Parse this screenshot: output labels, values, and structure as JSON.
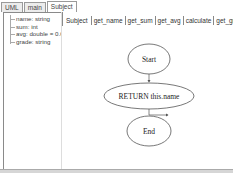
{
  "outer_tabs": [
    {
      "label": "UML",
      "active": false
    },
    {
      "label": "main",
      "active": false
    },
    {
      "label": "Subject",
      "active": true
    }
  ],
  "tree": {
    "items": [
      {
        "label": "name: string"
      },
      {
        "label": "sum: int"
      },
      {
        "label": "avg: double = 0.0"
      },
      {
        "label": "grade: string"
      }
    ]
  },
  "inner_tabs": [
    {
      "label": "Subject",
      "active": false
    },
    {
      "label": "get_name",
      "active": true
    },
    {
      "label": "get_sum",
      "active": false
    },
    {
      "label": "get_avg",
      "active": false
    },
    {
      "label": "calculate",
      "active": false
    },
    {
      "label": "get_grade",
      "active": false
    }
  ],
  "flowchart": {
    "nodes": [
      {
        "id": "start",
        "label": "Start"
      },
      {
        "id": "return",
        "label": "RETURN this.name"
      },
      {
        "id": "end",
        "label": "End"
      }
    ]
  }
}
